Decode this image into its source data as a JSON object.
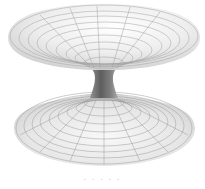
{
  "image": {
    "subject": "wormhole hyperboloid surface rendering",
    "description": "Grayscale 3D wireframe of two flared funnels connected by a narrow throat",
    "colors": {
      "background": "#ffffff",
      "surface_light": "#f4f4f4",
      "surface_dark": "#7a7a7a",
      "grid_line": "#8c8c8c",
      "throat": "#6e6e6e"
    }
  },
  "caption": {
    "text": "· · · · ·"
  }
}
